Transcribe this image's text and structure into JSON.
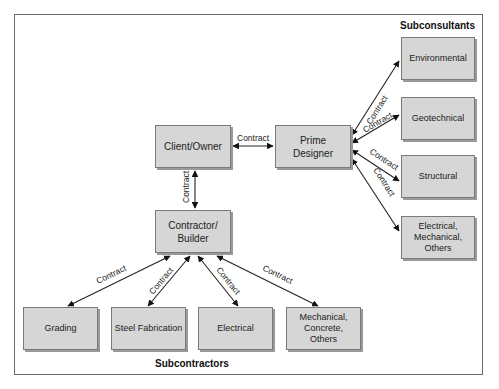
{
  "diagram": {
    "type": "contract-relationships",
    "groups": {
      "subconsultants": "Subconsultants",
      "subcontractors": "Subcontractors"
    },
    "nodes": {
      "client_owner": "Client/Owner",
      "prime_designer": "Prime\nDesigner",
      "contractor_builder": "Contractor/\nBuilder",
      "environmental": "Environmental",
      "geotechnical": "Geotechnical",
      "structural": "Structural",
      "electrical_mechanical_others": "Electrical,\nMechanical,\nOthers",
      "grading": "Grading",
      "steel_fabrication": "Steel Fabrication",
      "electrical": "Electrical",
      "mechanical_concrete_others": "Mechanical,\nConcrete,\nOthers"
    },
    "edge_label": "Contract",
    "edges": [
      {
        "from": "Client/Owner",
        "to": "Prime Designer",
        "label": "Contract"
      },
      {
        "from": "Client/Owner",
        "to": "Contractor/Builder",
        "label": "Contract"
      },
      {
        "from": "Prime Designer",
        "to": "Environmental",
        "label": "Contract"
      },
      {
        "from": "Prime Designer",
        "to": "Geotechnical",
        "label": "Contract"
      },
      {
        "from": "Prime Designer",
        "to": "Structural",
        "label": "Contract"
      },
      {
        "from": "Prime Designer",
        "to": "Electrical, Mechanical, Others",
        "label": "Contract"
      },
      {
        "from": "Contractor/Builder",
        "to": "Grading",
        "label": "Contract"
      },
      {
        "from": "Contractor/Builder",
        "to": "Steel Fabrication",
        "label": "Contract"
      },
      {
        "from": "Contractor/Builder",
        "to": "Electrical",
        "label": "Contract"
      },
      {
        "from": "Contractor/Builder",
        "to": "Mechanical, Concrete, Others",
        "label": "Contract"
      }
    ]
  }
}
